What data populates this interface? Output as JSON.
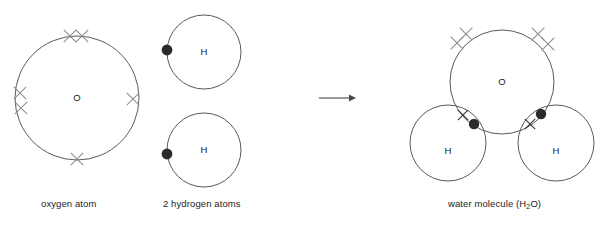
{
  "diagram": {
    "colors": {
      "circle_stroke": "#5a5a5a",
      "cross_light": "#8d8d8d",
      "cross_dark": "#3a3a3a",
      "dot_fill": "#2b2b2b",
      "arrow": "#4a4a4a",
      "text": "#1c1c1c",
      "background": "#ffffff"
    },
    "reactants": {
      "oxygen_atom": {
        "symbol": "O",
        "caption": "oxygen atom",
        "electron_symbol": "cross",
        "electron_count": 6,
        "electrons": [
          {
            "label": "top-left-cross",
            "cx": 70,
            "cy": 36
          },
          {
            "label": "top-right-cross",
            "cx": 82,
            "cy": 36
          },
          {
            "label": "left-upper-cross",
            "cx": 20,
            "cy": 93
          },
          {
            "label": "left-lower-cross",
            "cx": 21,
            "cy": 108
          },
          {
            "label": "right-cross",
            "cx": 133,
            "cy": 99
          },
          {
            "label": "bottom-cross",
            "cx": 77,
            "cy": 159
          }
        ],
        "circle": {
          "cx": 77,
          "cy": 98,
          "r": 62
        }
      },
      "hydrogen_atoms": {
        "caption": "2 hydrogen atoms",
        "count": 2,
        "symbol": "H",
        "electron_symbol": "dot",
        "electron_count_each": 1,
        "atoms": [
          {
            "label": "hydrogen-atom-top",
            "circle": {
              "cx": 204,
              "cy": 52,
              "r": 37
            },
            "electron": {
              "cx": 167,
              "cy": 50
            }
          },
          {
            "label": "hydrogen-atom-bottom",
            "circle": {
              "cx": 204,
              "cy": 150,
              "r": 37
            },
            "electron": {
              "cx": 167,
              "cy": 154
            }
          }
        ]
      }
    },
    "arrow": {
      "label": "reaction-arrow",
      "direction": "right",
      "x_start": 319,
      "x_end": 356,
      "y": 98
    },
    "product": {
      "water_molecule": {
        "caption_text": "water molecule (H",
        "caption_sub": "2",
        "caption_tail": "O)",
        "caption_full": "water molecule (H2O)",
        "oxygen": {
          "symbol": "O",
          "circle": {
            "cx": 502,
            "cy": 82,
            "r": 52
          },
          "lone_pairs": [
            {
              "label": "lone-pair-upper-left-cross-1",
              "cx": 466,
              "cy": 34
            },
            {
              "label": "lone-pair-upper-left-cross-2",
              "cx": 457,
              "cy": 43
            },
            {
              "label": "lone-pair-upper-right-cross-1",
              "cx": 538,
              "cy": 34
            },
            {
              "label": "lone-pair-upper-right-cross-2",
              "cx": 548,
              "cy": 44
            }
          ]
        },
        "hydrogens": [
          {
            "label": "bonded-hydrogen-left",
            "symbol": "H",
            "circle": {
              "cx": 448,
              "cy": 143,
              "r": 38
            },
            "shared_cross": {
              "cx": 463,
              "cy": 115
            },
            "shared_dot": {
              "cx": 474,
              "cy": 124
            }
          },
          {
            "label": "bonded-hydrogen-right",
            "symbol": "H",
            "circle": {
              "cx": 556,
              "cy": 143,
              "r": 38
            },
            "shared_cross": {
              "cx": 530,
              "cy": 124
            },
            "shared_dot": {
              "cx": 541,
              "cy": 114
            }
          }
        ]
      }
    }
  }
}
